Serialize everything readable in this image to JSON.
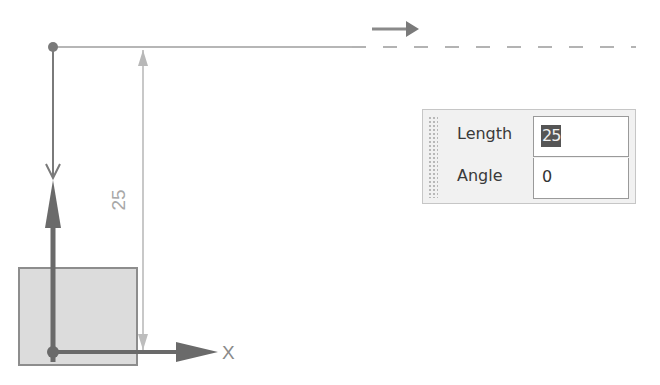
{
  "drawing": {
    "dimension_value": "25",
    "axis_label": "X",
    "colors": {
      "line_dark": "#6a6a6a",
      "line_light": "#c4c4c4",
      "dashed": "#bdbdbd",
      "shape_fill": "#dcdcdc",
      "shape_border": "#8d8d8d"
    }
  },
  "input_panel": {
    "fields": [
      {
        "label": "Length",
        "value": "25",
        "selected": true
      },
      {
        "label": "Angle",
        "value": "0",
        "selected": false
      }
    ]
  }
}
